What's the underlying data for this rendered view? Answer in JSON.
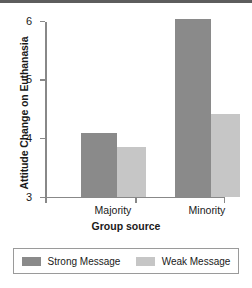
{
  "chart_data": {
    "type": "bar",
    "title": "",
    "xlabel": "Group source",
    "ylabel": "Attitude Change on Euthanasia",
    "categories": [
      "Majority",
      "Minority"
    ],
    "series": [
      {
        "name": "Strong Message",
        "values": [
          4.08,
          6.02
        ],
        "color": "#8a8a8a"
      },
      {
        "name": "Weak Message",
        "values": [
          3.85,
          4.4
        ],
        "color": "#c6c6c6"
      }
    ],
    "ylim": [
      3,
      6
    ],
    "yticks": [
      3,
      4,
      5,
      6
    ],
    "ytick_labels": [
      "3",
      "4",
      "5",
      "6"
    ],
    "grid": false,
    "legend_position": "bottom"
  },
  "legend": {
    "entries": [
      {
        "label": "Strong Message"
      },
      {
        "label": "Weak Message"
      }
    ]
  }
}
